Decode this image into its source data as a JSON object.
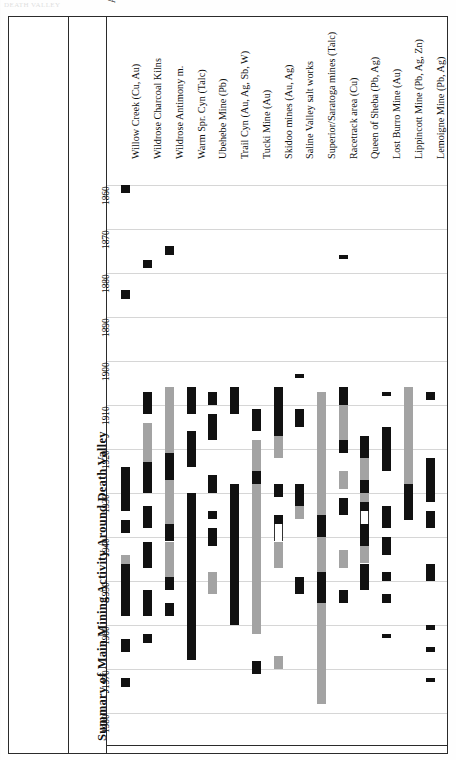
{
  "page": {
    "header_faint": "DEATH VALLEY",
    "title": "Summary of Main Mining Activity Around Death Valley"
  },
  "key": {
    "title": "Key:",
    "items": [
      {
        "label": "Discovery",
        "swatch": "discovery-tick"
      },
      {
        "label": "Assessment work",
        "swatch": "open-outline"
      },
      {
        "label": "Shut-down or Idle",
        "swatch": "idle-gap"
      },
      {
        "label": "Full activity",
        "swatch": "solid-black"
      },
      {
        "label": "Sporadic activity",
        "swatch": "solid-gray"
      },
      {
        "label": "Approximate date",
        "swatch": "taper-arrow"
      }
    ],
    "abbreviations": [
      "Ag=Silver",
      "Au=Gold",
      "Cu=Copper",
      "Hg=Mercury",
      "Pb=Lead",
      "Sb=Antimony",
      "W=Tungsten",
      "Zn=Zinc"
    ]
  },
  "chart_data": {
    "type": "bar",
    "title": "Summary of Main Mining Activity Around Death Valley",
    "xlabel": "",
    "ylabel": "",
    "ylim": [
      1855,
      1985
    ],
    "grid": true,
    "legend_position": "left-panel",
    "tick_labels": [
      "1860",
      "1870",
      "1880",
      "1890",
      "1900",
      "1910",
      "1920",
      "1930",
      "1940",
      "1950",
      "1960",
      "1970",
      "1980"
    ],
    "categories": [
      "Lemoigne Mine (Pb, Ag)",
      "Lippincott Mine (Pb, Ag, Zn)",
      "Lost Burro Mine (Au)",
      "Queen of Sheba (Pb, Ag)",
      "Racetrack area (Cu)",
      "Superior/Saratoga mines (Talc)",
      "Saline Valley salt works",
      "Skidoo mines (Au, Ag)",
      "Tucki Mine (Au)",
      "Trail Cyn (Au, Ag, Sb, W)",
      "Ubehebe Mine (Pb)",
      "Warm Spr. Cyn (Talc)",
      "Wildrose Antimony m.",
      "Wildrose Charcoal Kilns",
      "Willow Creek (Cu, Au)"
    ],
    "series": [
      {
        "name": "Lemoigne Mine (Pb, Ag)",
        "segments": [
          {
            "from": 1907,
            "to": 1909,
            "kind": "full"
          },
          {
            "from": 1922,
            "to": 1932,
            "kind": "full"
          },
          {
            "from": 1934,
            "to": 1938,
            "kind": "full"
          },
          {
            "from": 1946,
            "to": 1950,
            "kind": "full"
          },
          {
            "from": 1960,
            "to": 1961,
            "kind": "full"
          },
          {
            "from": 1965,
            "to": 1966,
            "kind": "full"
          },
          {
            "from": 1972,
            "to": 1973,
            "kind": "full"
          }
        ]
      },
      {
        "name": "Lippincott Mine (Pb, Ag, Zn)",
        "segments": [
          {
            "from": 1906,
            "to": 1928,
            "kind": "spor"
          },
          {
            "from": 1928,
            "to": 1936,
            "kind": "full"
          }
        ]
      },
      {
        "name": "Lost Burro Mine (Au)",
        "segments": [
          {
            "from": 1907,
            "to": 1908,
            "kind": "disc"
          },
          {
            "from": 1915,
            "to": 1925,
            "kind": "full"
          },
          {
            "from": 1933,
            "to": 1938,
            "kind": "full"
          },
          {
            "from": 1940,
            "to": 1944,
            "kind": "full"
          },
          {
            "from": 1948,
            "to": 1950,
            "kind": "full"
          },
          {
            "from": 1953,
            "to": 1955,
            "kind": "full"
          },
          {
            "from": 1962,
            "to": 1963,
            "kind": "full"
          }
        ]
      },
      {
        "name": "Queen of Sheba (Pb, Ag)",
        "segments": [
          {
            "from": 1917,
            "to": 1922,
            "kind": "full"
          },
          {
            "from": 1922,
            "to": 1927,
            "kind": "spor"
          },
          {
            "from": 1927,
            "to": 1930,
            "kind": "full"
          },
          {
            "from": 1930,
            "to": 1932,
            "kind": "spor"
          },
          {
            "from": 1932,
            "to": 1934,
            "kind": "full"
          },
          {
            "from": 1934,
            "to": 1937,
            "kind": "idle"
          },
          {
            "from": 1937,
            "to": 1942,
            "kind": "full"
          },
          {
            "from": 1942,
            "to": 1946,
            "kind": "spor"
          },
          {
            "from": 1946,
            "to": 1952,
            "kind": "full"
          }
        ]
      },
      {
        "name": "Racetrack area (Cu)",
        "segments": [
          {
            "from": 1876,
            "to": 1877,
            "kind": "disc"
          },
          {
            "from": 1906,
            "to": 1910,
            "kind": "full"
          },
          {
            "from": 1910,
            "to": 1918,
            "kind": "spor"
          },
          {
            "from": 1918,
            "to": 1921,
            "kind": "full"
          },
          {
            "from": 1925,
            "to": 1929,
            "kind": "spor"
          },
          {
            "from": 1931,
            "to": 1935,
            "kind": "full"
          },
          {
            "from": 1943,
            "to": 1947,
            "kind": "spor"
          },
          {
            "from": 1952,
            "to": 1955,
            "kind": "full"
          }
        ]
      },
      {
        "name": "Superior/Saratoga mines (Talc)",
        "segments": [
          {
            "from": 1907,
            "to": 1935,
            "kind": "spor"
          },
          {
            "from": 1935,
            "to": 1940,
            "kind": "full"
          },
          {
            "from": 1940,
            "to": 1948,
            "kind": "spor"
          },
          {
            "from": 1948,
            "to": 1955,
            "kind": "full"
          },
          {
            "from": 1955,
            "to": 1978,
            "kind": "spor"
          }
        ]
      },
      {
        "name": "Saline Valley salt works",
        "segments": [
          {
            "from": 1903,
            "to": 1904,
            "kind": "disc"
          },
          {
            "from": 1911,
            "to": 1915,
            "kind": "full"
          },
          {
            "from": 1928,
            "to": 1933,
            "kind": "full"
          },
          {
            "from": 1933,
            "to": 1936,
            "kind": "spor"
          },
          {
            "from": 1949,
            "to": 1953,
            "kind": "full"
          }
        ]
      },
      {
        "name": "Skidoo mines (Au, Ag)",
        "segments": [
          {
            "from": 1906,
            "to": 1917,
            "kind": "full"
          },
          {
            "from": 1917,
            "to": 1922,
            "kind": "spor"
          },
          {
            "from": 1928,
            "to": 1931,
            "kind": "full"
          },
          {
            "from": 1935,
            "to": 1937,
            "kind": "full"
          },
          {
            "from": 1937,
            "to": 1941,
            "kind": "idle"
          },
          {
            "from": 1941,
            "to": 1947,
            "kind": "spor"
          },
          {
            "from": 1967,
            "to": 1970,
            "kind": "spor"
          }
        ]
      },
      {
        "name": "Tucki Mine (Au)",
        "segments": [
          {
            "from": 1911,
            "to": 1916,
            "kind": "full"
          },
          {
            "from": 1918,
            "to": 1925,
            "kind": "spor"
          },
          {
            "from": 1925,
            "to": 1928,
            "kind": "full"
          },
          {
            "from": 1928,
            "to": 1948,
            "kind": "spor"
          },
          {
            "from": 1948,
            "to": 1962,
            "kind": "spor"
          },
          {
            "from": 1968,
            "to": 1971,
            "kind": "full"
          }
        ]
      },
      {
        "name": "Trail Cyn (Au, Ag, Sb, W)",
        "segments": [
          {
            "from": 1928,
            "to": 1933,
            "kind": "full"
          },
          {
            "from": 1906,
            "to": 1912,
            "kind": "full"
          },
          {
            "from": 1933,
            "to": 1941,
            "kind": "full"
          },
          {
            "from": 1941,
            "to": 1945,
            "kind": "full"
          },
          {
            "from": 1945,
            "to": 1960,
            "kind": "full"
          }
        ]
      },
      {
        "name": "Ubehebe Mine (Pb)",
        "segments": [
          {
            "from": 1907,
            "to": 1910,
            "kind": "full"
          },
          {
            "from": 1912,
            "to": 1918,
            "kind": "full"
          },
          {
            "from": 1926,
            "to": 1930,
            "kind": "full"
          },
          {
            "from": 1934,
            "to": 1936,
            "kind": "disc"
          },
          {
            "from": 1938,
            "to": 1942,
            "kind": "full"
          },
          {
            "from": 1948,
            "to": 1953,
            "kind": "spor"
          }
        ]
      },
      {
        "name": "Warm Spr. Cyn (Talc)",
        "segments": [
          {
            "from": 1906,
            "to": 1912,
            "kind": "full"
          },
          {
            "from": 1916,
            "to": 1924,
            "kind": "full"
          },
          {
            "from": 1930,
            "to": 1968,
            "kind": "full"
          }
        ]
      },
      {
        "name": "Wildrose Antimony m.",
        "segments": [
          {
            "from": 1874,
            "to": 1876,
            "kind": "full"
          },
          {
            "from": 1906,
            "to": 1921,
            "kind": "spor"
          },
          {
            "from": 1921,
            "to": 1927,
            "kind": "full"
          },
          {
            "from": 1927,
            "to": 1937,
            "kind": "spor"
          },
          {
            "from": 1937,
            "to": 1941,
            "kind": "full"
          },
          {
            "from": 1941,
            "to": 1949,
            "kind": "spor"
          },
          {
            "from": 1949,
            "to": 1952,
            "kind": "full"
          },
          {
            "from": 1955,
            "to": 1958,
            "kind": "full"
          }
        ]
      },
      {
        "name": "Wildrose Charcoal Kilns",
        "segments": [
          {
            "from": 1877,
            "to": 1879,
            "kind": "full"
          },
          {
            "from": 1907,
            "to": 1912,
            "kind": "full"
          },
          {
            "from": 1914,
            "to": 1923,
            "kind": "spor"
          },
          {
            "from": 1923,
            "to": 1930,
            "kind": "full"
          },
          {
            "from": 1933,
            "to": 1938,
            "kind": "full"
          },
          {
            "from": 1941,
            "to": 1947,
            "kind": "full"
          },
          {
            "from": 1952,
            "to": 1958,
            "kind": "full"
          },
          {
            "from": 1962,
            "to": 1964,
            "kind": "full"
          }
        ]
      },
      {
        "name": "Willow Creek (Cu, Au)",
        "segments": [
          {
            "from": 1860,
            "to": 1862,
            "kind": "full"
          },
          {
            "from": 1884,
            "to": 1886,
            "kind": "full"
          },
          {
            "from": 1924,
            "to": 1934,
            "kind": "full"
          },
          {
            "from": 1936,
            "to": 1939,
            "kind": "full"
          },
          {
            "from": 1944,
            "to": 1946,
            "kind": "spor"
          },
          {
            "from": 1946,
            "to": 1958,
            "kind": "full"
          },
          {
            "from": 1963,
            "to": 1966,
            "kind": "full"
          },
          {
            "from": 1972,
            "to": 1974,
            "kind": "full"
          }
        ]
      }
    ]
  }
}
